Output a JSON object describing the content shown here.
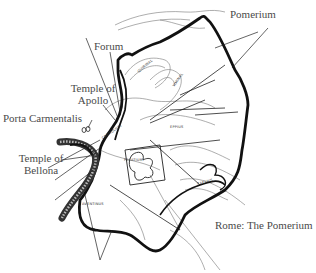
{
  "map": {
    "caption": "Rome: The Pomerium",
    "labels": {
      "pomerium": "Pomerium",
      "forum": "Forum",
      "temple_apollo_line1": "Temple of",
      "temple_apollo_line2": "Apollo",
      "porta_carmentalis": "Porta Carmentalis",
      "temple_bellona_line1": "Temple of",
      "temple_bellona_line2": "Bellona"
    },
    "hills": {
      "quirinal": "QUIRINAL",
      "viminal": "VIMINAL",
      "esquiline": "EPPIUS",
      "capitoline": "CAPITOLIUM",
      "palatine": "PALATIUM",
      "aventine": "AVENTINUS",
      "caelian": "CAELIUS"
    },
    "colors": {
      "boundary": "#111111",
      "river": "#333333",
      "text": "#4a4a4a"
    }
  }
}
